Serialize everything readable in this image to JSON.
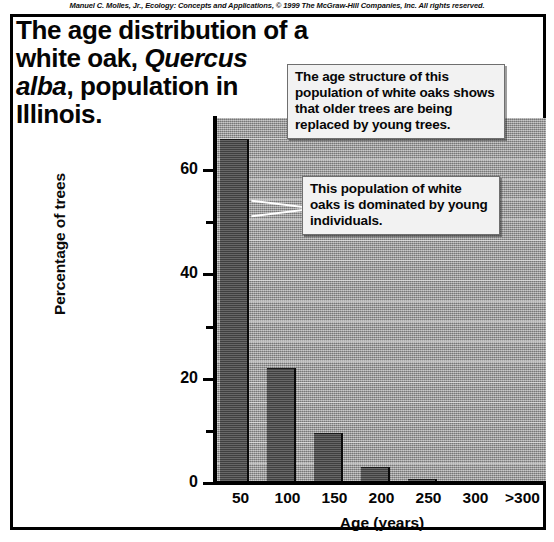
{
  "credit": "Manuel C. Molles, Jr., Ecology: Concepts and Applications, © 1999 The McGraw-Hill Companies, Inc. All rights reserved.",
  "title": {
    "line1": "The age distribution of a",
    "line2_a": "white oak, ",
    "line2_species": "Quercus",
    "line3_species": "alba",
    "line3_b": ", population in",
    "line4": "Illinois."
  },
  "callouts": [
    {
      "id": "callout-1",
      "text": "The age structure of this population of white oaks shows that older trees are being replaced by young trees."
    },
    {
      "id": "callout-2",
      "text": "This population of white oaks is dominated by young individuals."
    }
  ],
  "chart_data": {
    "type": "bar",
    "title": "The age distribution of a white oak, Quercus alba, population in Illinois.",
    "xlabel": "Age (years)",
    "ylabel": "Percentage of trees",
    "categories": [
      "50",
      "100",
      "150",
      "200",
      "250",
      "300",
      ">300"
    ],
    "values": [
      66,
      22,
      9.5,
      3,
      0.8,
      0.2,
      0.2
    ],
    "ylim": [
      0,
      70
    ],
    "yticks_major": [
      0,
      20,
      40,
      60
    ],
    "yticks_minor": [
      10,
      30,
      50
    ],
    "ytick_labels": [
      "0",
      "20",
      "40",
      "60"
    ],
    "grid": "faint-horizontal",
    "legend": "none",
    "bar_color": "#4e4e4e",
    "plot_background": "#9a9a9a"
  }
}
